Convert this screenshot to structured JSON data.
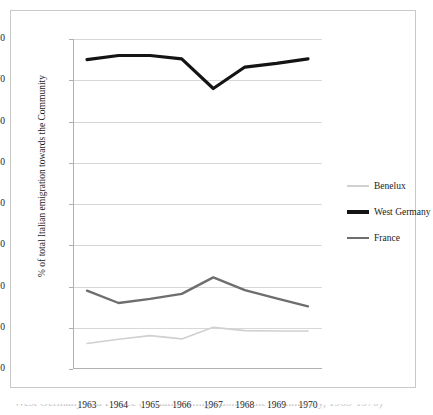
{
  "chart_data": {
    "type": "line",
    "title": "",
    "xlabel": "",
    "ylabel": "% of total Italian emigration towards the Community",
    "categories": [
      "1963",
      "1964",
      "1965",
      "1966",
      "1967",
      "1968",
      "1969",
      "1970"
    ],
    "x": [
      1963,
      1964,
      1965,
      1966,
      1967,
      1968,
      1969,
      1970
    ],
    "ylim": [
      0,
      80
    ],
    "ytick_values": [
      0,
      10,
      20,
      30,
      40,
      50,
      60,
      70,
      80
    ],
    "ytick_labels": [
      "0",
      "10",
      "20",
      "30",
      "40",
      "50",
      "60",
      "70",
      "80"
    ],
    "grid": "horizontal",
    "legend_position": "right-center",
    "series": [
      {
        "name": "Benelux",
        "color": "#d0d0d0",
        "width": 1.6,
        "values": [
          6.2,
          7.2,
          8.1,
          7.3,
          10.1,
          9.3,
          9.2,
          9.2
        ]
      },
      {
        "name": "West Germany",
        "color": "#141414",
        "width": 3.2,
        "values": [
          75.0,
          76.0,
          76.0,
          75.2,
          68.0,
          73.2,
          74.1,
          75.2
        ]
      },
      {
        "name": "France",
        "color": "#6e6e6e",
        "width": 2.4,
        "values": [
          19.0,
          16.0,
          17.0,
          18.2,
          22.2,
          19.1,
          17.1,
          15.2
        ]
      }
    ]
  },
  "legend": {
    "items": [
      {
        "label": "Benelux"
      },
      {
        "label": "West Germany"
      },
      {
        "label": "France"
      }
    ]
  },
  "caption": {
    "text": "West Germany and France (% Italian emigration to the Community, 1963-1970)"
  }
}
